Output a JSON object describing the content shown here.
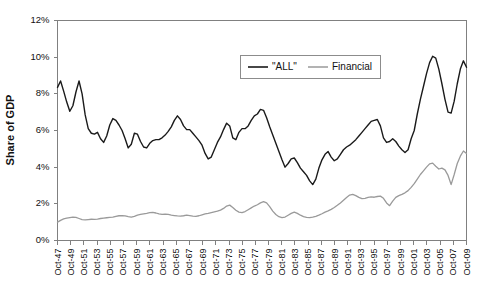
{
  "chart_data": {
    "type": "line",
    "title": "",
    "xlabel": "",
    "ylabel": "Share of GDP",
    "ylim": [
      0,
      12
    ],
    "yticks": [
      0,
      2,
      4,
      6,
      8,
      10,
      12
    ],
    "ytick_labels": [
      "0%",
      "2%",
      "4%",
      "6%",
      "8%",
      "10%",
      "12%"
    ],
    "grid": false,
    "legend_position": "top-center",
    "x_start_label": "Oct-47",
    "x_end_label": "Oct-09",
    "x_tick_step_years": 2,
    "xtick_labels": [
      "Oct-47",
      "Oct-49",
      "Oct-51",
      "Oct-53",
      "Oct-55",
      "Oct-57",
      "Oct-59",
      "Oct-61",
      "Oct-63",
      "Oct-65",
      "Oct-67",
      "Oct-69",
      "Oct-71",
      "Oct-73",
      "Oct-75",
      "Oct-77",
      "Oct-79",
      "Oct-81",
      "Oct-83",
      "Oct-85",
      "Oct-87",
      "Oct-89",
      "Oct-91",
      "Oct-93",
      "Oct-95",
      "Oct-97",
      "Oct-99",
      "Oct-01",
      "Oct-03",
      "Oct-05",
      "Oct-07",
      "Oct-09"
    ],
    "series": [
      {
        "name": "\"ALL\"",
        "color": "#1a1a1a",
        "values": [
          8.35,
          8.7,
          8.15,
          7.55,
          7.05,
          7.35,
          8.1,
          8.7,
          8.0,
          6.85,
          6.1,
          5.85,
          5.8,
          5.9,
          5.55,
          5.35,
          5.7,
          6.3,
          6.65,
          6.55,
          6.3,
          6.0,
          5.55,
          5.05,
          5.25,
          5.85,
          5.8,
          5.4,
          5.1,
          5.05,
          5.3,
          5.45,
          5.5,
          5.5,
          5.6,
          5.75,
          5.95,
          6.2,
          6.55,
          6.8,
          6.6,
          6.25,
          6.05,
          6.05,
          5.85,
          5.65,
          5.45,
          5.2,
          4.75,
          4.45,
          4.55,
          4.95,
          5.35,
          5.65,
          6.05,
          6.4,
          6.25,
          5.6,
          5.5,
          5.9,
          6.1,
          6.1,
          6.25,
          6.55,
          6.8,
          6.9,
          7.15,
          7.1,
          6.7,
          6.2,
          5.75,
          5.3,
          4.85,
          4.4,
          4.0,
          4.2,
          4.45,
          4.5,
          4.25,
          3.95,
          3.75,
          3.55,
          3.25,
          3.05,
          3.35,
          3.95,
          4.4,
          4.7,
          4.85,
          4.55,
          4.35,
          4.45,
          4.7,
          4.95,
          5.1,
          5.2,
          5.35,
          5.5,
          5.7,
          5.9,
          6.1,
          6.3,
          6.5,
          6.55,
          6.6,
          6.25,
          5.6,
          5.35,
          5.4,
          5.55,
          5.4,
          5.15,
          4.95,
          4.8,
          4.95,
          5.55,
          6.0,
          6.9,
          7.7,
          8.4,
          9.1,
          9.7,
          10.05,
          9.95,
          9.35,
          8.55,
          7.7,
          7.0,
          6.95,
          7.6,
          8.55,
          9.35,
          9.8,
          9.45
        ]
      },
      {
        "name": "Financial",
        "color": "#9a9a9a",
        "values": [
          1.0,
          1.1,
          1.18,
          1.22,
          1.25,
          1.28,
          1.26,
          1.2,
          1.14,
          1.12,
          1.14,
          1.16,
          1.15,
          1.17,
          1.2,
          1.22,
          1.24,
          1.26,
          1.28,
          1.32,
          1.35,
          1.36,
          1.34,
          1.3,
          1.28,
          1.32,
          1.38,
          1.42,
          1.45,
          1.48,
          1.52,
          1.53,
          1.5,
          1.45,
          1.42,
          1.44,
          1.42,
          1.38,
          1.36,
          1.34,
          1.33,
          1.35,
          1.38,
          1.36,
          1.33,
          1.32,
          1.35,
          1.4,
          1.45,
          1.48,
          1.52,
          1.56,
          1.6,
          1.66,
          1.75,
          1.88,
          1.93,
          1.8,
          1.65,
          1.55,
          1.52,
          1.58,
          1.68,
          1.78,
          1.88,
          1.95,
          2.05,
          2.12,
          2.05,
          1.85,
          1.6,
          1.42,
          1.3,
          1.25,
          1.28,
          1.38,
          1.48,
          1.55,
          1.48,
          1.38,
          1.3,
          1.26,
          1.25,
          1.28,
          1.32,
          1.38,
          1.46,
          1.55,
          1.62,
          1.7,
          1.8,
          1.92,
          2.05,
          2.2,
          2.35,
          2.48,
          2.52,
          2.45,
          2.35,
          2.28,
          2.3,
          2.35,
          2.38,
          2.36,
          2.4,
          2.42,
          2.3,
          2.05,
          1.9,
          2.15,
          2.35,
          2.45,
          2.52,
          2.6,
          2.72,
          2.9,
          3.1,
          3.35,
          3.6,
          3.8,
          4.0,
          4.18,
          4.22,
          4.05,
          3.9,
          3.95,
          3.85,
          3.55,
          3.05,
          3.6,
          4.2,
          4.6,
          4.88,
          4.75
        ]
      }
    ]
  },
  "legend": {
    "entries": [
      {
        "label": "\"ALL\"",
        "color": "#1a1a1a"
      },
      {
        "label": "Financial",
        "color": "#9a9a9a"
      }
    ]
  },
  "axes": {
    "y_title": "Share of GDP"
  }
}
